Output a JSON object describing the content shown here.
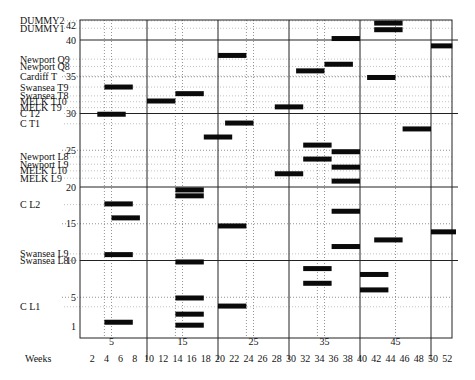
{
  "chart_data": {
    "type": "gantt",
    "title": "",
    "xlabel": "Weeks",
    "ylabel": "",
    "xlim": [
      0,
      53
    ],
    "ylim": [
      0,
      43
    ],
    "x_ticks": [
      2,
      4,
      6,
      8,
      10,
      12,
      14,
      16,
      18,
      20,
      22,
      24,
      26,
      28,
      30,
      32,
      34,
      36,
      38,
      40,
      42,
      44,
      46,
      48,
      50,
      52
    ],
    "x_major_labels": [
      5,
      15,
      25,
      35,
      45
    ],
    "x_solid_lines": [
      10,
      20,
      30,
      40,
      50
    ],
    "x_dotted_lines": [
      4,
      5,
      14,
      15,
      24,
      25,
      34,
      35,
      45
    ],
    "y_ticks": [
      1,
      5,
      10,
      15,
      20,
      25,
      30,
      35,
      40,
      42
    ],
    "y_solid_lines": [
      10,
      20,
      30,
      40
    ],
    "y_dotted_lines": [
      5,
      15,
      25,
      35
    ],
    "row_labels": [
      {
        "label": "DUMMY2",
        "level": 42.6
      },
      {
        "label": "DUMMY1",
        "level": 41.6
      },
      {
        "label": "Newport Q9",
        "level": 37.4
      },
      {
        "label": "Newport Q8",
        "level": 36.4
      },
      {
        "label": "Cardiff T",
        "level": 35.1
      },
      {
        "label": "Swansea T9",
        "level": 33.6
      },
      {
        "label": "Swansea T8",
        "level": 32.4
      },
      {
        "label": "MELK T10",
        "level": 31.6
      },
      {
        "label": "MELK T9",
        "level": 30.8
      },
      {
        "label": "C T2",
        "level": 30.0
      },
      {
        "label": "C T1",
        "level": 28.6
      },
      {
        "label": "Newport L8",
        "level": 24.1
      },
      {
        "label": "Newport L9",
        "level": 23.1
      },
      {
        "label": "MELK L10",
        "level": 22.2
      },
      {
        "label": "MELK L9",
        "level": 21.2
      },
      {
        "label": "C L2",
        "level": 17.6
      },
      {
        "label": "Swansea L9",
        "level": 10.9
      },
      {
        "label": "Swansea L8",
        "level": 10.0
      },
      {
        "label": "C L1",
        "level": 3.7
      }
    ],
    "bars": [
      {
        "start": 42,
        "end": 46,
        "level": 42.3
      },
      {
        "start": 42,
        "end": 46,
        "level": 41.4
      },
      {
        "start": 36,
        "end": 40,
        "level": 40.2
      },
      {
        "start": 50,
        "end": 53,
        "level": 39.2
      },
      {
        "start": 20,
        "end": 24,
        "level": 37.9
      },
      {
        "start": 35,
        "end": 39,
        "level": 36.7
      },
      {
        "start": 31,
        "end": 35,
        "level": 35.8
      },
      {
        "start": 41,
        "end": 45,
        "level": 34.9
      },
      {
        "start": 4,
        "end": 8,
        "level": 33.6
      },
      {
        "start": 14,
        "end": 18,
        "level": 32.7
      },
      {
        "start": 10,
        "end": 14,
        "level": 31.7
      },
      {
        "start": 28,
        "end": 32,
        "level": 30.9
      },
      {
        "start": 3,
        "end": 7,
        "level": 29.9
      },
      {
        "start": 21,
        "end": 25,
        "level": 28.7
      },
      {
        "start": 46,
        "end": 50,
        "level": 27.9
      },
      {
        "start": 18,
        "end": 22,
        "level": 26.8
      },
      {
        "start": 32,
        "end": 36,
        "level": 25.7
      },
      {
        "start": 36,
        "end": 40,
        "level": 24.8
      },
      {
        "start": 32,
        "end": 36,
        "level": 23.8
      },
      {
        "start": 36,
        "end": 40,
        "level": 22.7
      },
      {
        "start": 28,
        "end": 32,
        "level": 21.8
      },
      {
        "start": 36,
        "end": 40,
        "level": 20.8
      },
      {
        "start": 14,
        "end": 18,
        "level": 19.6
      },
      {
        "start": 14,
        "end": 18,
        "level": 18.8
      },
      {
        "start": 4,
        "end": 8,
        "level": 17.7
      },
      {
        "start": 36,
        "end": 40,
        "level": 16.7
      },
      {
        "start": 5,
        "end": 9,
        "level": 15.8
      },
      {
        "start": 20,
        "end": 24,
        "level": 14.7
      },
      {
        "start": 50,
        "end": 54,
        "level": 13.9
      },
      {
        "start": 42,
        "end": 46,
        "level": 12.8
      },
      {
        "start": 36,
        "end": 40,
        "level": 11.9
      },
      {
        "start": 4,
        "end": 8,
        "level": 10.8
      },
      {
        "start": 14,
        "end": 18,
        "level": 9.8
      },
      {
        "start": 32,
        "end": 36,
        "level": 8.9
      },
      {
        "start": 40,
        "end": 44,
        "level": 8.1
      },
      {
        "start": 32,
        "end": 36,
        "level": 6.9
      },
      {
        "start": 40,
        "end": 44,
        "level": 6.0
      },
      {
        "start": 14,
        "end": 18,
        "level": 4.9
      },
      {
        "start": 20,
        "end": 24,
        "level": 3.8
      },
      {
        "start": 14,
        "end": 18,
        "level": 2.7
      },
      {
        "start": 4,
        "end": 8,
        "level": 1.6
      },
      {
        "start": 14,
        "end": 18,
        "level": 1.2
      }
    ],
    "grid": true,
    "legend": null
  },
  "axis": {
    "weeks_label": "Weeks"
  }
}
